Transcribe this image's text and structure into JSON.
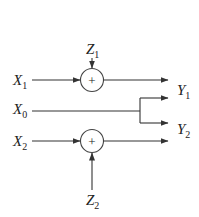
{
  "diagram": {
    "title": "",
    "colors": {
      "line": "#333333",
      "text": "#222222",
      "background": "#ffffff"
    },
    "inputs": [
      {
        "id": "X1",
        "base": "X",
        "sub": "1"
      },
      {
        "id": "X0",
        "base": "X",
        "sub": "0"
      },
      {
        "id": "X2",
        "base": "X",
        "sub": "2"
      }
    ],
    "noise": [
      {
        "id": "Z1",
        "base": "Z",
        "sub": "1"
      },
      {
        "id": "Z2",
        "base": "Z",
        "sub": "2"
      }
    ],
    "outputs": [
      {
        "id": "Y1",
        "base": "Y",
        "sub": "1"
      },
      {
        "id": "Y2",
        "base": "Y",
        "sub": "2"
      }
    ],
    "adders": [
      {
        "id": "adder-1",
        "symbol": "+"
      },
      {
        "id": "adder-2",
        "symbol": "+"
      }
    ],
    "edges": [
      {
        "from": "Z1",
        "to": "adder-1"
      },
      {
        "from": "X1",
        "to": "adder-1"
      },
      {
        "from": "adder-1",
        "to": "Y1"
      },
      {
        "from": "X0",
        "to": "Y1"
      },
      {
        "from": "X0",
        "to": "Y2"
      },
      {
        "from": "X2",
        "to": "adder-2"
      },
      {
        "from": "Z2",
        "to": "adder-2"
      },
      {
        "from": "adder-2",
        "to": "Y2"
      }
    ]
  }
}
